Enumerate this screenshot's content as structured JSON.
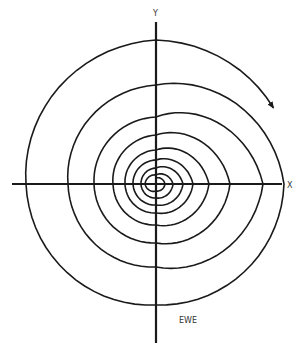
{
  "diagram": {
    "type": "spiral",
    "labels": {
      "x_axis": "X",
      "y_axis": "Y",
      "caption": "EWE"
    },
    "colors": {
      "line": "#1a1a1a",
      "background": "#ffffff"
    },
    "center": [
      156,
      184
    ],
    "axes": {
      "x": {
        "from": 12,
        "to": 282
      },
      "y": {
        "from": 22,
        "to": 343
      }
    },
    "spiral": {
      "direction": "clockwise-outward",
      "arrow_at_end": true,
      "radius_samples_deg_clockwise_from_top": [
        [
          0,
          6
        ],
        [
          90,
          9
        ],
        [
          180,
          7
        ],
        [
          270,
          11
        ],
        [
          360,
          9
        ],
        [
          450,
          17
        ],
        [
          540,
          14
        ],
        [
          630,
          15
        ],
        [
          720,
          16
        ],
        [
          810,
          27
        ],
        [
          900,
          21
        ],
        [
          990,
          23
        ],
        [
          1080,
          24
        ],
        [
          1170,
          37
        ],
        [
          1260,
          29
        ],
        [
          1350,
          31
        ],
        [
          1440,
          34
        ],
        [
          1530,
          53
        ],
        [
          1620,
          41
        ],
        [
          1710,
          43
        ],
        [
          1800,
          49
        ],
        [
          1890,
          74
        ],
        [
          1980,
          59
        ],
        [
          2070,
          62
        ],
        [
          2160,
          67
        ],
        [
          2250,
          107
        ],
        [
          2340,
          83
        ],
        [
          2430,
          88
        ],
        [
          2520,
          99
        ],
        [
          2610,
          128
        ],
        [
          2700,
          121
        ],
        [
          2790,
          130
        ],
        [
          2880,
          144
        ],
        [
          2937,
          140
        ]
      ]
    }
  }
}
